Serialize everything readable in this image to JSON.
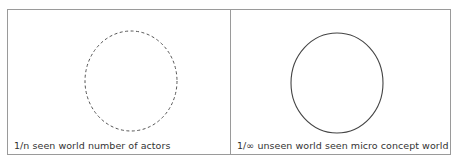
{
  "panels": [
    {
      "id": "seen",
      "caption": "1/n seen world number of actors",
      "circle": {
        "style": "dashed",
        "cx": 123,
        "cy": 71,
        "rx": 46,
        "ry": 50,
        "stroke": "#555555"
      }
    },
    {
      "id": "unseen",
      "caption": "1/∞ unseen world seen micro concept world",
      "circle": {
        "style": "solid",
        "cx": 106,
        "cy": 73,
        "rx": 46,
        "ry": 50,
        "stroke": "#444444"
      }
    }
  ],
  "colors": {
    "border": "#9a9a9a",
    "text": "#333333",
    "background": "#ffffff"
  }
}
